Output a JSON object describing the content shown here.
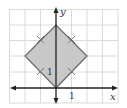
{
  "diagram": {
    "title": "",
    "x_axis_label": "x",
    "y_axis_label": "y",
    "x_tick_label": "1",
    "y_tick_label": "1",
    "grid": {
      "x_min": -3,
      "x_max": 4,
      "y_min": -1,
      "y_max": 5
    },
    "shape": {
      "type": "square",
      "vertices": [
        [
          0,
          0
        ],
        [
          2,
          2
        ],
        [
          0,
          4
        ],
        [
          -2,
          2
        ]
      ],
      "fill": "#c8c8c8",
      "stroke": "#666666",
      "congruent_side_tick_marks": 4
    },
    "colors": {
      "grid": "#d0d0d0",
      "axes": "#222222",
      "background": "#ffffff"
    }
  }
}
